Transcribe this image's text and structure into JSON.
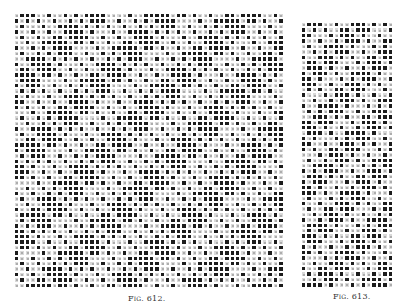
{
  "figures": [
    {
      "id": "fig-612",
      "caption_prefix": "Fig.",
      "caption_number": "612.",
      "grid": {
        "x": 14,
        "y": 13,
        "cols": 50,
        "rows": 51,
        "pitch": 5.4
      },
      "pattern": {
        "band_width": 7,
        "band_offset": 3,
        "light_dot_step": 3,
        "dark_hole_step": 5,
        "hexagons": true
      },
      "caption_pos": {
        "x": 128,
        "y": 294
      }
    },
    {
      "id": "fig-613",
      "caption_prefix": "Fig.",
      "caption_number": "613.",
      "grid": {
        "x": 301,
        "y": 22,
        "cols": 17,
        "rows": 49,
        "pitch": 5.43
      },
      "pattern": {
        "band_width": 5,
        "band_offset": 1,
        "light_dot_step": 3,
        "dark_hole_step": 4,
        "hexagons": false
      },
      "caption_pos": {
        "x": 333,
        "y": 292
      }
    }
  ],
  "colors": {
    "filled": "#1c1c1c",
    "empty": "#ffffff",
    "gridline": "#ffffff"
  }
}
